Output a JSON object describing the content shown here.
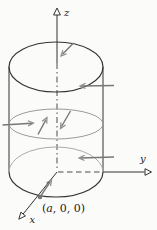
{
  "figure": {
    "type": "3d-cylinder-with-inward-normal-vectors",
    "axes": {
      "z_label": "z",
      "y_label": "y",
      "x_label": "x"
    },
    "point": {
      "label": "(a, 0, 0)",
      "open": "(",
      "var": "a",
      "rest": ", 0, 0)"
    },
    "colors": {
      "outline": "#333333",
      "hidden_edge": "#ababab",
      "cross_section": "#9a9a9a",
      "vector": "#777777",
      "background": "#fbfbfa"
    }
  }
}
